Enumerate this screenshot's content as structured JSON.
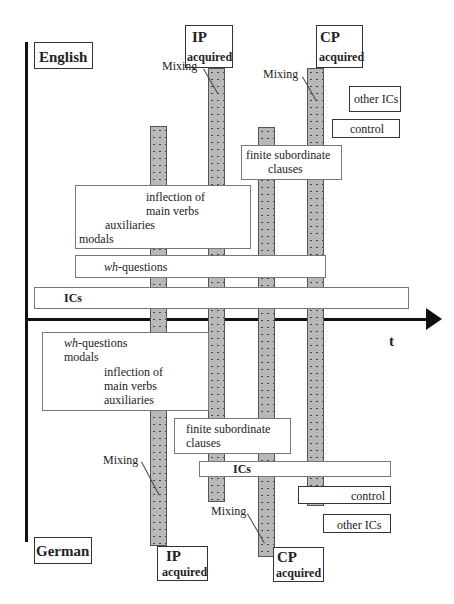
{
  "languages": {
    "top": "English",
    "bottom": "German"
  },
  "axis": {
    "time_label": "t"
  },
  "english": {
    "ip": {
      "title": "IP",
      "sub": "acquired"
    },
    "cp": {
      "title": "CP",
      "sub": "acquired"
    },
    "mixing1": "Mixing",
    "mixing2": "Mixing",
    "other_ics": "other ICs",
    "control": "control",
    "finite": {
      "line1": "finite subordinate",
      "line2": "clauses"
    },
    "inflection": {
      "line1": "inflection of",
      "line2": "main verbs",
      "line3": "auxiliaries",
      "line4": "modals"
    },
    "wh": {
      "italic": "wh",
      "rest": "-questions"
    },
    "ics": "ICs"
  },
  "german": {
    "wh": {
      "italic": "wh",
      "rest": "-questions"
    },
    "modals": "modals",
    "inflection": {
      "line1": "inflection of",
      "line2": "main verbs",
      "line3": "auxiliaries"
    },
    "finite": {
      "line1": "finite subordinate",
      "line2": "clauses"
    },
    "mixing1": "Mixing",
    "mixing2": "Mixing",
    "ics": "ICs",
    "control": "control",
    "other_ics": "other ICs",
    "ip": {
      "title": "IP",
      "sub": "acquired"
    },
    "cp": {
      "title": "CP",
      "sub": "acquired"
    }
  }
}
